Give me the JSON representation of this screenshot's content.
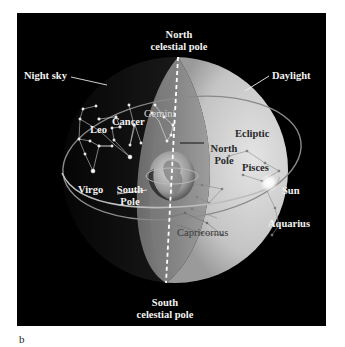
{
  "figure": {
    "panel_label": "b",
    "background": "#000000",
    "labels": {
      "north_celestial_pole": [
        "North",
        "celestial pole"
      ],
      "south_celestial_pole": [
        "South",
        "celestial pole"
      ],
      "night_sky": "Night sky",
      "daylight": "Daylight",
      "ecliptic": "Ecliptic",
      "north_pole": [
        "North",
        "Pole"
      ],
      "south_pole": [
        "South",
        "Pole"
      ],
      "sun": "Sun",
      "constellations": {
        "gemini": "Gemini",
        "cancer": "Cancer",
        "leo": "Leo",
        "virgo": "Virgo",
        "pisces": "Pisces",
        "aquarius": "Aquarius",
        "capricornus": "Capricornus"
      }
    },
    "colors": {
      "night_side": "#1a1a1a",
      "day_side": "#c8c8c8",
      "axis": "#ffffff",
      "sun_glow": "#ffffff"
    }
  }
}
